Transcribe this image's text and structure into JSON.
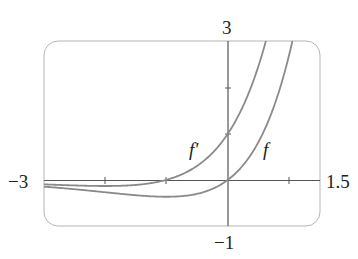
{
  "chart_data": {
    "type": "line",
    "title": "",
    "xlabel": "",
    "ylabel": "",
    "xlim": [
      -3,
      1.5
    ],
    "ylim": [
      -1,
      3
    ],
    "grid": false,
    "x_ticks": [
      -2,
      -1,
      1
    ],
    "y_ticks": [
      1,
      2
    ],
    "tick_labels": {
      "x_min": "−3",
      "x_max": "1.5",
      "y_max": "3",
      "y_min": "−1"
    },
    "series": [
      {
        "name": "f",
        "label": "f",
        "formula": "x·e^x",
        "x": [
          -3,
          -2,
          -1,
          -0.5,
          0,
          0.5,
          0.88
        ],
        "values": [
          -0.15,
          -0.27,
          -0.37,
          -0.3,
          0,
          0.82,
          2.12
        ]
      },
      {
        "name": "f'",
        "label": "f′",
        "formula": "(x+1)·e^x",
        "x": [
          -3,
          -2,
          -1,
          -0.5,
          0,
          0.5,
          0.7
        ],
        "values": [
          -0.1,
          -0.14,
          0,
          0.3,
          1,
          2.47,
          3.43
        ]
      }
    ],
    "annotations": [
      {
        "text": "f′",
        "near": [
          -0.5,
          0.7
        ]
      },
      {
        "text": "f",
        "near": [
          0.65,
          0.7
        ]
      }
    ]
  },
  "labels": {
    "y_top": "3",
    "y_bottom": "−1",
    "x_left": "−3",
    "x_right": "1.5",
    "f_prime": "f′",
    "f": "f"
  },
  "colors": {
    "curve": "#8a8a8a",
    "axis": "#555555",
    "frame": "#b5b5b5"
  }
}
